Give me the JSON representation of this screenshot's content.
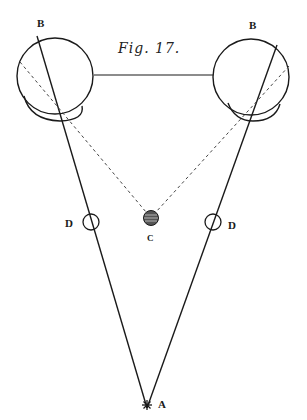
{
  "figure": {
    "title": "Fig. 17.",
    "labels": {
      "left_eye": "B",
      "right_eye": "B",
      "left_lens": "D",
      "right_lens": "D",
      "center_object": "C",
      "apex_point": "A"
    }
  },
  "colors": {
    "ink": "#1a1a1a",
    "background": "#ffffff"
  }
}
